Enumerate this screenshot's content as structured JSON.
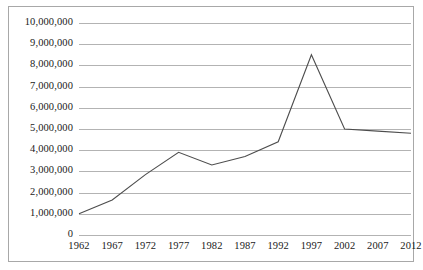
{
  "chart_data": {
    "type": "line",
    "title": "",
    "xlabel": "",
    "ylabel": "",
    "grid": true,
    "legend": false,
    "xlim": [
      1962,
      2012
    ],
    "ylim": [
      0,
      10000000
    ],
    "ytick_step": 1000000,
    "categories": [
      "1962",
      "1967",
      "1972",
      "1977",
      "1982",
      "1987",
      "1992",
      "1997",
      "2002",
      "2007",
      "2012"
    ],
    "x": [
      1962,
      1967,
      1972,
      1977,
      1982,
      1987,
      1992,
      1997,
      2002,
      2007,
      2012
    ],
    "values": [
      1000000,
      1650000,
      2850000,
      3900000,
      3300000,
      3700000,
      4400000,
      8500000,
      5000000,
      4900000,
      4800000
    ],
    "ytick_labels": [
      "10,000,000",
      "9,000,000",
      "8,000,000",
      "7,000,000",
      "6,000,000",
      "5,000,000",
      "4,000,000",
      "3,000,000",
      "2,000,000",
      "1,000,000",
      "0"
    ],
    "ytick_values": [
      10000000,
      9000000,
      8000000,
      7000000,
      6000000,
      5000000,
      4000000,
      3000000,
      2000000,
      1000000,
      0
    ],
    "series": [
      {
        "name": "",
        "values": [
          1000000,
          1650000,
          2850000,
          3900000,
          3300000,
          3700000,
          4400000,
          8500000,
          5000000,
          4900000,
          4800000
        ]
      }
    ],
    "colors": {
      "line": "#4d4d4d",
      "gridline": "#b3b3b3",
      "border": "#a8a8a8",
      "text": "#1a1a1a",
      "background": "#ffffff"
    }
  }
}
